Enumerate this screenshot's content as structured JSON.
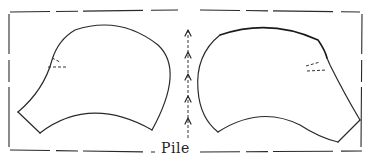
{
  "diagram": {
    "type": "sewing-pattern-sketch",
    "pieces": [
      {
        "name": "left-piece",
        "has_dart": true
      },
      {
        "name": "right-piece",
        "has_dart": true
      }
    ],
    "grain_arrows": {
      "count": 5,
      "direction": "up"
    },
    "label": "Pile",
    "colors": {
      "ink": "#2a2a2a",
      "background": "#ffffff"
    }
  }
}
